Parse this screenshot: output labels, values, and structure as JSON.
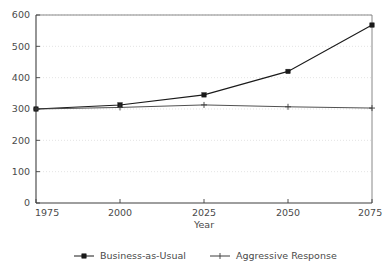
{
  "chart_data": {
    "type": "line",
    "title": "",
    "xlabel": "Year",
    "ylabel": "",
    "x": [
      1975,
      2000,
      2025,
      2050,
      2075
    ],
    "xticklabels": [
      "1975",
      "2000",
      "2025",
      "2050",
      "2075"
    ],
    "yticks": [
      0,
      100,
      200,
      300,
      400,
      500,
      600
    ],
    "yticklabels": [
      "0",
      "100",
      "200",
      "300",
      "400",
      "500",
      "600"
    ],
    "xlim": [
      1975,
      2075
    ],
    "ylim": [
      0,
      600
    ],
    "grid": "horizontal-dotted",
    "legend_position": "below-bottom-center",
    "series": [
      {
        "name": "Business-as-Usual",
        "marker": "square",
        "color": "#1a1a1a",
        "values": [
          300,
          313,
          345,
          420,
          568
        ]
      },
      {
        "name": "Aggressive Response",
        "marker": "plus",
        "color": "#3c3c3c",
        "values": [
          300,
          305,
          313,
          307,
          303
        ]
      }
    ]
  },
  "axes": {
    "x_axis_title": "Year",
    "y_axis_title": ""
  },
  "legend": {
    "entries": [
      {
        "label": "Business-as-Usual",
        "marker": "square-marker-icon"
      },
      {
        "label": "Aggressive Response",
        "marker": "plus-marker-icon"
      }
    ]
  },
  "colors": {
    "axis": "#555555",
    "grid": "#d8d8d8",
    "series_primary": "#1a1a1a",
    "series_secondary": "#3c3c3c",
    "text": "#4a4a4a",
    "background": "#ffffff"
  }
}
